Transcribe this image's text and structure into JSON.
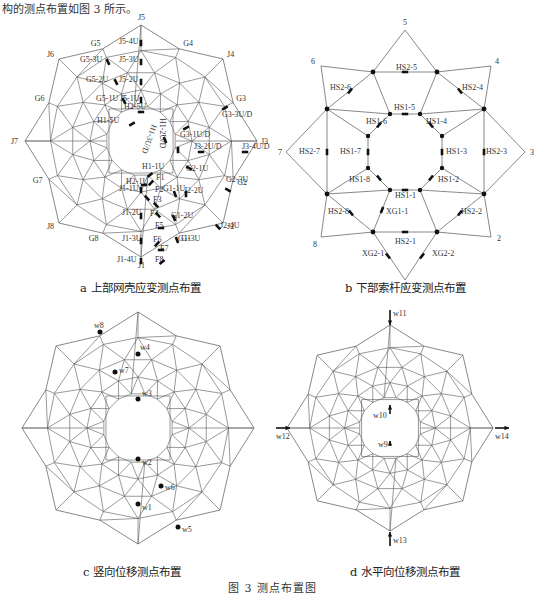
{
  "top_text": "构的测点布置如图 3 所示。",
  "figure_caption": "图 3   测点布置图",
  "panels": {
    "a": {
      "caption": "a  上部网壳应变测点布置",
      "outer_nodes": [
        "J1",
        "J2",
        "J3",
        "J4",
        "J5",
        "J6",
        "J7",
        "J8"
      ],
      "mid_nodes": [
        "G1",
        "G2",
        "G3",
        "G4",
        "G5",
        "G6",
        "G7",
        "G8"
      ],
      "strain_labels": [
        "J5-4U",
        "J5-3U",
        "J5-2U",
        "J5-1U",
        "G5-3U",
        "G5-2U",
        "G5-1U",
        "H2-5U",
        "H1-5U",
        "H1-3U/D",
        "H1-2U/D",
        "G3-3U/D",
        "G3-1U/D",
        "J3-2U/D",
        "J3-4U/D",
        "G2-1U",
        "G2-3U",
        "H1-1U",
        "H2-1U",
        "J1-1U",
        "F1",
        "F2",
        "F3",
        "F4",
        "F5",
        "F6",
        "F7",
        "F8",
        "G1-1U",
        "J2-2U",
        "J1-2U",
        "G1-2U",
        "J2-4U",
        "J1-3U",
        "G1-3U",
        "J1-4U"
      ]
    },
    "b": {
      "caption": "b  下部索杆应变测点布置",
      "outer_nodes": [
        "1",
        "2",
        "3",
        "4",
        "5",
        "6",
        "7",
        "8"
      ],
      "labels": [
        "HS2-5",
        "HS2-6",
        "HS2-4",
        "HS1-5",
        "HS1-6",
        "HS1-4",
        "HS2-7",
        "HS1-7",
        "HS1-3",
        "HS2-3",
        "HS1-8",
        "HS1-2",
        "HS1-1",
        "HS2-8",
        "XG1-1",
        "HS2-2",
        "HS2-1",
        "XG2-1",
        "XG2-2"
      ]
    },
    "c": {
      "caption": "c  竖向位移测点布置",
      "points": [
        "w1",
        "w2",
        "w3",
        "w4",
        "w5",
        "w6",
        "w7",
        "w8"
      ]
    },
    "d": {
      "caption": "d  水平向位移测点布置",
      "points": [
        "w9",
        "w10",
        "w11",
        "w12",
        "w13",
        "w14"
      ]
    }
  },
  "colors": {
    "line": "#555555",
    "marker": "#111111",
    "background": "#ffffff"
  }
}
